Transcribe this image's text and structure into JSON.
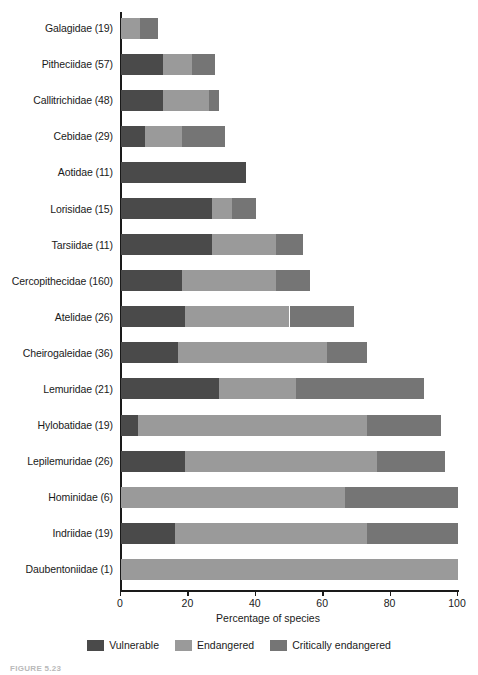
{
  "figure": {
    "caption": "FIGURE 5.23"
  },
  "legend": {
    "position": "bottom-center",
    "items": [
      {
        "label": "Vulnerable",
        "color": "#4a4a4a"
      },
      {
        "label": "Endangered",
        "color": "#9a9a9a"
      },
      {
        "label": "Critically endangered",
        "color": "#757575"
      }
    ]
  },
  "axis": {
    "x_title": "Percentage of species",
    "tick_labels": [
      "0",
      "20",
      "40",
      "60",
      "80",
      "100"
    ]
  },
  "chart_data": {
    "type": "bar",
    "orientation": "horizontal",
    "stacked": true,
    "title": "",
    "subtitle": "",
    "xlabel": "Percentage of species",
    "ylabel": "",
    "xlim": [
      0,
      100
    ],
    "xticks": [
      0,
      20,
      40,
      60,
      80,
      100
    ],
    "grid": false,
    "legend_position": "bottom-center",
    "categories": [
      "Galagidae (19)",
      "Pitheciidae (57)",
      "Callitrichidae (48)",
      "Cebidae (29)",
      "Aotidae (11)",
      "Lorisidae (15)",
      "Tarsiidae (11)",
      "Cercopithecidae (160)",
      "Atelidae (26)",
      "Cheirogaleidae (36)",
      "Lemuridae (21)",
      "Hylobatidae (19)",
      "Lepilemuridae (26)",
      "Hominidae (6)",
      "Indriidae (19)",
      "Daubentoniidae (1)"
    ],
    "series": [
      {
        "name": "Vulnerable",
        "color": "#4a4a4a",
        "values": [
          0,
          12.5,
          12.5,
          7,
          37,
          27,
          27,
          18,
          19,
          17,
          29,
          5,
          19,
          0,
          16,
          0
        ]
      },
      {
        "name": "Endangered",
        "color": "#9a9a9a",
        "values": [
          5.5,
          8.5,
          13.5,
          11,
          0,
          6,
          19,
          28,
          31,
          44,
          23,
          68,
          57,
          66.5,
          57,
          100
        ]
      },
      {
        "name": "Critically endangered",
        "color": "#757575",
        "values": [
          5.5,
          7,
          3,
          13,
          0,
          7,
          8,
          10,
          19,
          12,
          38,
          22,
          20,
          33.5,
          27,
          0
        ]
      }
    ],
    "totals": [
      11,
      28,
      29,
      31,
      37,
      40,
      54,
      56,
      69,
      73,
      90,
      95,
      96,
      100,
      100,
      100
    ]
  }
}
